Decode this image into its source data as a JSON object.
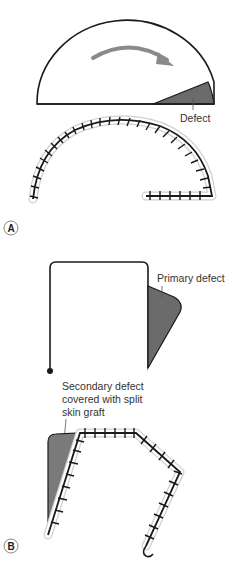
{
  "figure": {
    "panels": [
      {
        "id": "A",
        "letter": "A",
        "labels": {
          "defect": "Defect"
        },
        "elements": [
          "semicircular-flap",
          "rotation-arrow",
          "defect-triangle",
          "sutured-closure-arc"
        ]
      },
      {
        "id": "B",
        "letter": "B",
        "labels": {
          "primary_defect": "Primary defect",
          "secondary_defect_line1": "Secondary defect",
          "secondary_defect_line2": "covered with split",
          "secondary_defect_line3": "skin graft"
        },
        "elements": [
          "transposition-flap-outline",
          "primary-defect",
          "secondary-defect-graft",
          "sutured-closure"
        ]
      }
    ],
    "colors": {
      "outline": "#1a1a1a",
      "defect_fill": "#6b6b6b",
      "arrow": "#8a8a8a",
      "suture_halo": "#d0d0d0",
      "label_text": "#333333"
    }
  }
}
